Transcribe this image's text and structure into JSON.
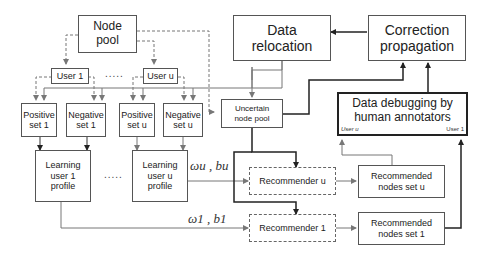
{
  "nodes": {
    "node_pool": "Node\npool",
    "user_1": "User 1",
    "user_u": "User u",
    "positive_set_1": "Positive\nset 1",
    "negative_set_1": "Negative\nset 1",
    "positive_set_u": "Positive\nset u",
    "negative_set_u": "Negative\nset u",
    "learning_user_1": "Learning\nuser 1\nprofile",
    "learning_user_u": "Learning\nuser u\nprofile",
    "data_relocation": "Data\nrelocation",
    "correction_propagation": "Correction\npropagation",
    "uncertain_node_pool": "Uncertain\nnode pool",
    "data_debugging": "Data debugging by\nhuman annotators",
    "data_debugging_user_u": "User u",
    "data_debugging_user_1": "User 1",
    "recommender_u": "Recommender u",
    "recommender_1": "Recommender 1",
    "recommended_set_u": "Recommended\nnodes set u",
    "recommended_set_1": "Recommended\nnodes set 1"
  },
  "labels": {
    "ellipsis_users": ".....",
    "ellipsis_profiles": ".....",
    "params_u": "ωu , bu",
    "params_1": "ω1 , b1"
  },
  "colors": {
    "line_gray": "#777777",
    "line_dark": "#222222",
    "border": "#555555"
  }
}
